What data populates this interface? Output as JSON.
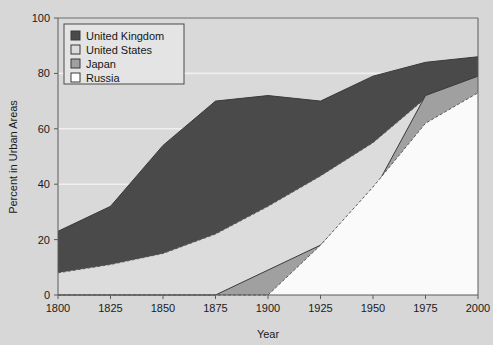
{
  "chart_data": {
    "type": "area",
    "title": "",
    "subtitle": "",
    "xlabel": "Year",
    "ylabel": "Percent in Urban Areas",
    "xlim": [
      1800,
      2000
    ],
    "ylim": [
      0,
      100
    ],
    "xticks": [
      1800,
      1825,
      1850,
      1875,
      1900,
      1925,
      1950,
      1975,
      2000
    ],
    "yticks": [
      0,
      20,
      40,
      60,
      80,
      100
    ],
    "xtick_labels": [
      "1800",
      "1825",
      "1850",
      "1875",
      "1900",
      "1925",
      "1950",
      "1975",
      "2000"
    ],
    "ytick_labels": [
      "0",
      "20",
      "40",
      "60",
      "80",
      "100"
    ],
    "grid": true,
    "grid_axis": "y",
    "stacked": false,
    "legend_position": "top-left",
    "x": [
      1800,
      1825,
      1850,
      1875,
      1900,
      1925,
      1950,
      1975,
      2000
    ],
    "series": [
      {
        "name": "United Kingdom",
        "color": "#4a4a4a",
        "outline": "solid",
        "values": [
          23,
          32,
          54,
          70,
          72,
          70,
          79,
          84,
          86
        ]
      },
      {
        "name": "United States",
        "color": "#dcdcdc",
        "outline": "dashed",
        "values": [
          8,
          11,
          15,
          22,
          32,
          43,
          55,
          71,
          76
        ]
      },
      {
        "name": "Japan",
        "color": "#a0a0a0",
        "outline": "solid",
        "values": [
          0,
          0,
          0,
          0,
          9,
          18,
          37,
          72,
          79
        ]
      },
      {
        "name": "Russia",
        "color": "#fafafa",
        "outline": "dashed",
        "values": [
          0,
          0,
          0,
          0,
          0,
          18,
          39,
          62,
          73
        ]
      }
    ]
  },
  "legend": {
    "items": [
      {
        "label": "United Kingdom",
        "swatch": "#4a4a4a"
      },
      {
        "label": "United States",
        "swatch": "#dcdcdc"
      },
      {
        "label": "Japan",
        "swatch": "#a0a0a0"
      },
      {
        "label": "Russia",
        "swatch": "#ffffff"
      }
    ]
  },
  "colors": {
    "page_background": "#d7d7d7",
    "plot_background": "#d9d9d9",
    "axis": "#5a5a5a",
    "gridline": "#f0f0f0",
    "text": "#1a1a1a"
  }
}
